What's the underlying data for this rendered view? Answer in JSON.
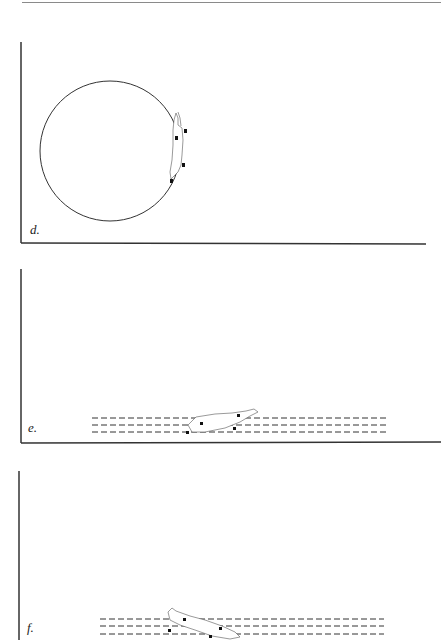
{
  "figure": {
    "panels": [
      {
        "id": "d",
        "label": "d.",
        "description": "Circular path with figure swimming along the right edge of the circle",
        "path_type": "circle"
      },
      {
        "id": "e",
        "label": "e.",
        "description": "Figure swimming horizontally across three dashed lane lines",
        "path_type": "dashed-lanes"
      },
      {
        "id": "f",
        "label": "f.",
        "description": "Figure swimming diagonally across three dashed lane lines",
        "path_type": "dashed-lanes"
      }
    ],
    "colors": {
      "line": "#333333",
      "marker": "#111111",
      "outline": "#555555"
    }
  }
}
